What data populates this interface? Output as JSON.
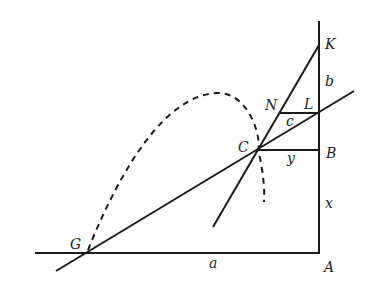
{
  "diagram": {
    "points": {
      "K": {
        "label": "K",
        "x": 319,
        "y": 45
      },
      "L": {
        "label": "L",
        "x": 319,
        "y": 113
      },
      "N": {
        "label": "N",
        "x": 279,
        "y": 113
      },
      "B": {
        "label": "B",
        "x": 319,
        "y": 150
      },
      "C": {
        "label": "C",
        "x": 257,
        "y": 150
      },
      "G": {
        "label": "G",
        "x": 86,
        "y": 253
      },
      "A": {
        "label": "A",
        "x": 319,
        "y": 253
      }
    },
    "segment_labels": {
      "a": "a",
      "b": "b",
      "c": "c",
      "x": "x",
      "y": "y"
    },
    "colors": {
      "stroke": "#1a1a1a",
      "background": "#ffffff"
    }
  }
}
